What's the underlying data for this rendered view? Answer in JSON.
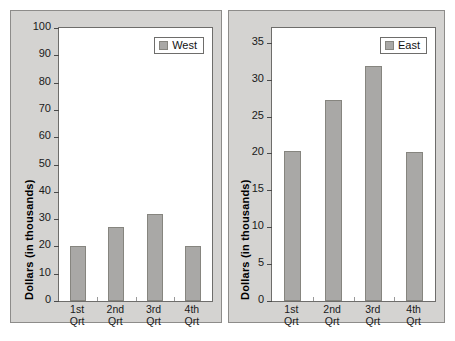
{
  "chart_data": [
    {
      "type": "bar",
      "id": "west",
      "title": "",
      "xlabel": "",
      "ylabel": "Dollars (in thousands)",
      "categories": [
        "1st\nQrt",
        "2nd\nQrt",
        "3rd\nQrt",
        "4th\nQrt"
      ],
      "series": [
        {
          "name": "West",
          "values": [
            20.3,
            27.2,
            31.8,
            20.2
          ]
        }
      ],
      "ylim": [
        0,
        100
      ],
      "yticks": [
        0,
        10,
        20,
        30,
        40,
        50,
        60,
        70,
        80,
        90,
        100
      ],
      "ytick_labels": [
        "0",
        "10",
        "20",
        "30",
        "40",
        "50",
        "60",
        "70",
        "80",
        "90",
        "100"
      ],
      "grid": false,
      "legend_position": "top-right",
      "legend_entries": [
        "West"
      ],
      "bar_color": "#a9a8a6",
      "bar_edge_color": "#86857f"
    },
    {
      "type": "bar",
      "id": "east",
      "title": "",
      "xlabel": "",
      "ylabel": "Dollars (in thousands)",
      "categories": [
        "1st\nQrt",
        "2nd\nQrt",
        "3rd\nQrt",
        "4th\nQrt"
      ],
      "series": [
        {
          "name": "East",
          "values": [
            20.3,
            27.2,
            31.8,
            20.2
          ]
        }
      ],
      "ylim": [
        0,
        37
      ],
      "yticks": [
        0,
        5,
        10,
        15,
        20,
        25,
        30,
        35
      ],
      "ytick_labels": [
        "0",
        "5",
        "10",
        "15",
        "20",
        "25",
        "30",
        "35"
      ],
      "grid": false,
      "legend_position": "top-right",
      "legend_entries": [
        "East"
      ],
      "bar_color": "#a9a8a6",
      "bar_edge_color": "#86857f"
    }
  ],
  "colors": {
    "panel_background": "#d4d3d1",
    "panel_border": "#8d8c8a",
    "plot_background": "#ffffff",
    "plot_border": "#6e6d6b",
    "bar_fill": "#a9a8a6",
    "bar_edge": "#86857f",
    "text": "#1a1a1a"
  }
}
